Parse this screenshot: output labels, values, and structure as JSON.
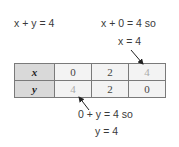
{
  "equation": "x + y = 4",
  "annotation_top": {
    "line1": "x + 0 = 4 so",
    "line2": "x = 4"
  },
  "annotation_bottom": {
    "line1": "0 + y = 4 so",
    "line2": "y = 4"
  },
  "table": {
    "rows": [
      {
        "header": "x",
        "values": [
          "0",
          "2",
          "4"
        ]
      },
      {
        "header": "y",
        "values": [
          "4",
          "2",
          "0"
        ]
      }
    ],
    "highlighted_cells": [
      {
        "row": 0,
        "col": 2
      },
      {
        "row": 1,
        "col": 0
      }
    ]
  },
  "colors": {
    "header_bg": "#d9d9d9",
    "cell_bg": "#f3f3f3",
    "faded_text": "#aaaaaa",
    "border": "#7a7a7a"
  }
}
